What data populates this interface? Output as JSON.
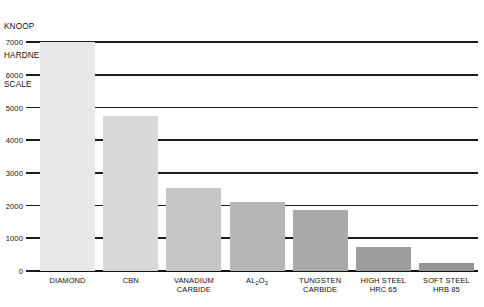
{
  "axis_title": {
    "lines": [
      "KNOOP",
      "HARDNESS",
      "SCALE"
    ]
  },
  "chart_data": {
    "type": "bar",
    "title": "KNOOP HARDNESS SCALE",
    "xlabel": "",
    "ylabel": "KNOOP HARDNESS SCALE",
    "ylim": [
      0,
      7000
    ],
    "yticks": [
      0,
      1000,
      2000,
      3000,
      4000,
      5000,
      6000,
      7000
    ],
    "ytick_labels": [
      "0",
      "1000",
      "2000",
      "3000",
      "4000",
      "5000",
      "6000",
      "7000"
    ],
    "grid": true,
    "legend": false,
    "categories": [
      "DIAMOND",
      "CBN",
      "VANADIUM CARBIDE",
      "AL2O3",
      "TUNGSTEN CARBIDE",
      "HIGH STEEL HRC 65",
      "SOFT STEEL HRB 85"
    ],
    "category_labels": [
      {
        "line1": "DIAMOND",
        "line2": ""
      },
      {
        "line1": "CBN",
        "line2": ""
      },
      {
        "line1": "VANADIUM",
        "line2": "CARBIDE"
      },
      {
        "line1": "AL",
        "sub1": "2",
        "mid": "O",
        "sub2": "3",
        "line2": ""
      },
      {
        "line1": "TUNGSTEN",
        "line2": "CARBIDE"
      },
      {
        "line1": "HIGH STEEL",
        "line2": "HRC 65"
      },
      {
        "line1": "SOFT STEEL",
        "line2": "HRB 85"
      }
    ],
    "values": [
      7000,
      4750,
      2530,
      2100,
      1850,
      730,
      250
    ],
    "bar_colors": [
      "#e8e8e8",
      "#d8d8d8",
      "#c6c6c6",
      "#b6b6b6",
      "#a9a9a9",
      "#9e9e9e",
      "#949494"
    ],
    "axis_color": "#1c1c1c",
    "background": "#ffffff"
  }
}
